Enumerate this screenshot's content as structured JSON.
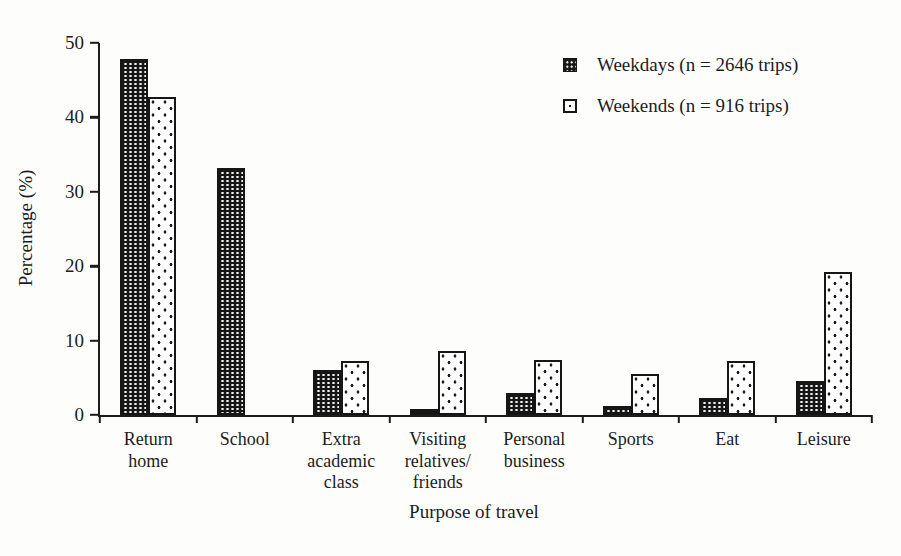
{
  "chart_data": {
    "type": "bar",
    "title": "",
    "xlabel": "Purpose of travel",
    "ylabel": "Percentage (%)",
    "ylim": [
      0,
      50
    ],
    "yticks": [
      0,
      10,
      20,
      30,
      40,
      50
    ],
    "grid": false,
    "legend_position": "top-right",
    "categories": [
      "Return\nhome",
      "School",
      "Extra\nacademic\nclass",
      "Visiting\nrelatives/\nfriends",
      "Personal\nbusiness",
      "Sports",
      "Eat",
      "Leisure"
    ],
    "series": [
      {
        "name": "Weekdays (n = 2646 trips)",
        "pattern": "black-with-white-dots",
        "values": [
          47.9,
          33.2,
          6.0,
          0.8,
          2.9,
          1.2,
          2.3,
          4.6
        ]
      },
      {
        "name": "Weekends (n = 916 trips)",
        "pattern": "white-with-black-dots",
        "values": [
          42.7,
          0,
          7.2,
          8.6,
          7.4,
          5.5,
          7.3,
          19.2
        ]
      }
    ],
    "ink_color": "#1c1c1c",
    "background_color": "#fdfdfc"
  }
}
